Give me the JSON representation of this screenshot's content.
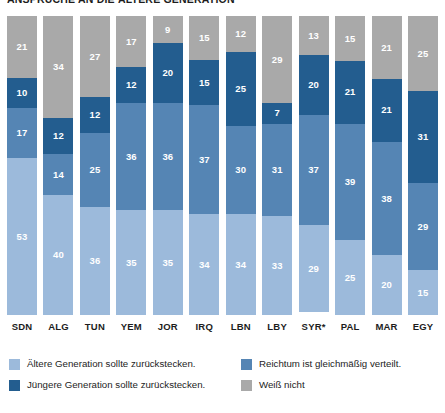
{
  "chart_data": {
    "type": "bar",
    "subtype": "stacked-percentage-column",
    "title": "ANSPRÜCHE AN DIE ÄLTERE GENERATION",
    "xlabel": "",
    "ylabel": "",
    "ylim": [
      0,
      100
    ],
    "grid": false,
    "legend_position": "bottom",
    "categories": [
      "SDN",
      "ALG",
      "TUN",
      "YEM",
      "JOR",
      "IRQ",
      "LBN",
      "LBY",
      "SYR*",
      "PAL",
      "MAR",
      "EGY"
    ],
    "stack_order_bottom_to_top": [
      "light_blue",
      "medium_blue",
      "dark_blue",
      "gray"
    ],
    "series": [
      {
        "name": "Ältere Generation sollte zurückstecken.",
        "key": "light_blue",
        "color": "#9cbadb",
        "values": [
          53,
          40,
          36,
          35,
          35,
          34,
          34,
          33,
          29,
          25,
          20,
          15
        ]
      },
      {
        "name": "Reichtum ist gleichmäßig verteilt.",
        "key": "medium_blue",
        "color": "#5585b4",
        "values": [
          17,
          14,
          25,
          36,
          36,
          37,
          30,
          31,
          37,
          39,
          38,
          29
        ]
      },
      {
        "name": "Jüngere Generation sollte zurückstecken.",
        "key": "dark_blue",
        "color": "#235d8f",
        "values": [
          10,
          12,
          12,
          12,
          20,
          15,
          25,
          7,
          20,
          21,
          21,
          31
        ]
      },
      {
        "name": "Weiß nicht",
        "key": "gray",
        "color": "#a9a9a9",
        "values": [
          21,
          34,
          27,
          17,
          9,
          15,
          12,
          29,
          13,
          15,
          21,
          25
        ]
      }
    ]
  },
  "legend": {
    "entries": [
      {
        "label": "Ältere Generation sollte zurückstecken.",
        "color": "#9cbadb",
        "swatch": "legend-swatch-light-blue"
      },
      {
        "label": "Reichtum ist gleichmäßig verteilt.",
        "color": "#5585b4",
        "swatch": "legend-swatch-medium-blue"
      },
      {
        "label": "Jüngere Generation sollte zurückstecken.",
        "color": "#235d8f",
        "swatch": "legend-swatch-dark-blue"
      },
      {
        "label": "Weiß nicht",
        "color": "#a9a9a9",
        "swatch": "legend-swatch-gray"
      }
    ]
  },
  "colors": {
    "light_blue": "#9cbadb",
    "medium_blue": "#5585b4",
    "dark_blue": "#235d8f",
    "gray": "#a9a9a9",
    "background": "#ffffff",
    "text": "#1d1d1d"
  }
}
